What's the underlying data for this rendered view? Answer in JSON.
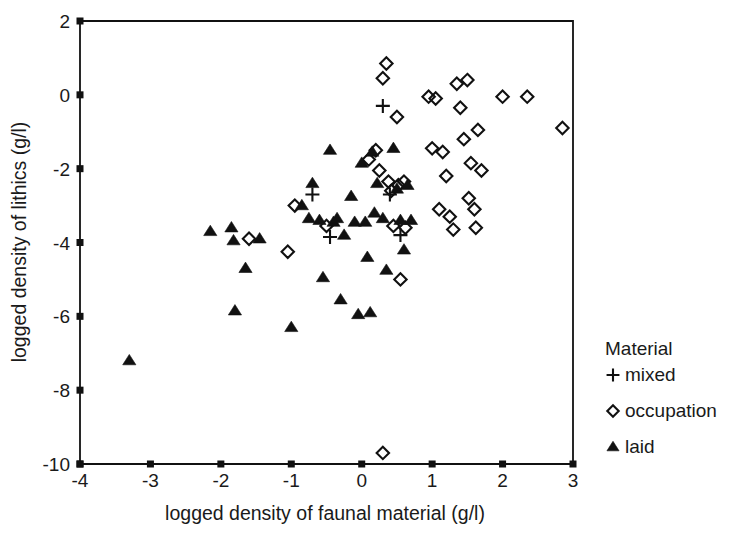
{
  "chart_data": {
    "type": "scatter",
    "title": "",
    "xlabel": "logged density of faunal material (g/l)",
    "ylabel": "logged density of lithics (g/l)",
    "xlim": [
      -4,
      3
    ],
    "ylim": [
      -10,
      2
    ],
    "xticks": [
      -4,
      -3,
      -2,
      -1,
      0,
      1,
      2,
      3
    ],
    "yticks": [
      2,
      0,
      -2,
      -4,
      -6,
      -8,
      -10
    ],
    "xtick_labels": [
      "-4",
      "-3",
      "-2",
      "-1",
      "0",
      "1",
      "2",
      "3"
    ],
    "ytick_labels": [
      "2",
      "0",
      "-2",
      "-4",
      "-6",
      "-8",
      "-10"
    ],
    "grid": false,
    "legend_position": "right",
    "legend_title": "Material",
    "series": [
      {
        "name": "mixed",
        "marker": "plus",
        "points": [
          [
            -0.7,
            -2.7
          ],
          [
            0.3,
            -0.3
          ],
          [
            0.4,
            -2.7
          ],
          [
            0.55,
            -3.8
          ],
          [
            -0.45,
            -3.85
          ]
        ]
      },
      {
        "name": "occupation",
        "marker": "open-diamond",
        "points": [
          [
            -1.6,
            -3.9
          ],
          [
            -1.05,
            -4.25
          ],
          [
            -0.95,
            -3.0
          ],
          [
            -0.5,
            -3.55
          ],
          [
            0.1,
            -1.75
          ],
          [
            0.2,
            -1.5
          ],
          [
            0.25,
            -2.05
          ],
          [
            0.3,
            0.45
          ],
          [
            0.35,
            0.85
          ],
          [
            0.38,
            -2.35
          ],
          [
            0.42,
            -2.6
          ],
          [
            0.45,
            -3.55
          ],
          [
            0.5,
            -0.6
          ],
          [
            0.52,
            -2.45
          ],
          [
            0.55,
            -5.0
          ],
          [
            0.6,
            -2.35
          ],
          [
            0.62,
            -3.6
          ],
          [
            0.3,
            -9.7
          ],
          [
            0.95,
            -0.05
          ],
          [
            1.0,
            -1.45
          ],
          [
            1.05,
            -0.1
          ],
          [
            1.1,
            -3.1
          ],
          [
            1.15,
            -1.55
          ],
          [
            1.2,
            -2.2
          ],
          [
            1.25,
            -3.3
          ],
          [
            1.3,
            -3.65
          ],
          [
            1.35,
            0.3
          ],
          [
            1.4,
            -0.35
          ],
          [
            1.45,
            -1.2
          ],
          [
            1.5,
            0.4
          ],
          [
            1.52,
            -2.8
          ],
          [
            1.55,
            -1.85
          ],
          [
            1.6,
            -3.1
          ],
          [
            1.62,
            -3.6
          ],
          [
            1.65,
            -0.95
          ],
          [
            1.7,
            -2.05
          ],
          [
            2.0,
            -0.05
          ],
          [
            2.35,
            -0.05
          ],
          [
            2.85,
            -0.9
          ]
        ]
      },
      {
        "name": "laid",
        "marker": "filled-triangle",
        "points": [
          [
            -3.3,
            -7.2
          ],
          [
            -2.15,
            -3.7
          ],
          [
            -1.85,
            -3.6
          ],
          [
            -1.82,
            -3.95
          ],
          [
            -1.8,
            -5.85
          ],
          [
            -1.65,
            -4.7
          ],
          [
            -1.45,
            -3.9
          ],
          [
            -1.0,
            -6.3
          ],
          [
            -0.85,
            -3.0
          ],
          [
            -0.75,
            -3.35
          ],
          [
            -0.7,
            -2.4
          ],
          [
            -0.6,
            -3.4
          ],
          [
            -0.55,
            -4.95
          ],
          [
            -0.45,
            -1.5
          ],
          [
            -0.4,
            -3.45
          ],
          [
            -0.35,
            -3.35
          ],
          [
            -0.3,
            -5.55
          ],
          [
            -0.25,
            -3.8
          ],
          [
            -0.15,
            -2.75
          ],
          [
            -0.1,
            -3.45
          ],
          [
            -0.05,
            -5.95
          ],
          [
            0.0,
            -1.85
          ],
          [
            0.05,
            -3.45
          ],
          [
            0.08,
            -4.4
          ],
          [
            0.12,
            -5.9
          ],
          [
            0.15,
            -1.55
          ],
          [
            0.18,
            -3.2
          ],
          [
            0.22,
            -2.4
          ],
          [
            0.3,
            -3.35
          ],
          [
            0.35,
            -4.75
          ],
          [
            0.45,
            -1.45
          ],
          [
            0.5,
            -2.55
          ],
          [
            0.55,
            -3.4
          ],
          [
            0.6,
            -4.2
          ],
          [
            0.65,
            -2.45
          ],
          [
            0.7,
            -3.4
          ]
        ]
      }
    ]
  },
  "legend": {
    "title": "Material",
    "items": [
      {
        "label": "mixed",
        "marker": "plus-icon"
      },
      {
        "label": "occupation",
        "marker": "open-diamond-icon"
      },
      {
        "label": "laid",
        "marker": "filled-triangle-icon"
      }
    ]
  }
}
